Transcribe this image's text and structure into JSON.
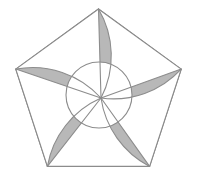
{
  "figure": {
    "name": "pentagon-pinwheel",
    "title": "Shaded regular pentagon with circular hole and five-fold pinwheel arcs",
    "canvas": {
      "width": 197,
      "height": 190,
      "background": "#ffffff"
    },
    "colors": {
      "background": "#ffffff",
      "fill": "#b8b8b8",
      "stroke": "#8c8c8c",
      "hole": "#ffffff",
      "sliver": "#ffffff"
    },
    "stroke_width": 1.1,
    "pentagon": {
      "shape": "regular-pentagon",
      "center": {
        "x": 98.5,
        "y": 96.0
      },
      "circumradius": 87.0,
      "rotation_deg": -90,
      "vertex_count": 5,
      "vertices": [
        {
          "label": "top",
          "x": 98.5,
          "y": 9.0
        },
        {
          "label": "right",
          "x": 181.2,
          "y": 69.1
        },
        {
          "label": "bottom-right",
          "x": 149.6,
          "y": 166.4
        },
        {
          "label": "bottom-left",
          "x": 47.4,
          "y": 166.4
        },
        {
          "label": "left",
          "x": 15.8,
          "y": 69.1
        }
      ]
    },
    "hole": {
      "shape": "circle",
      "center": {
        "x": 99.0,
        "y": 95.0
      },
      "radius": 33.0,
      "fill": "#ffffff"
    },
    "arcs": {
      "count": 5,
      "description": "One curved arc springs from each pentagon vertex and sweeps clockwise into a common convergence point just right of and below the figure centre, producing a five-fold pinwheel.",
      "convergence_point": {
        "x": 101.0,
        "y": 98.0
      },
      "sweep": "clockwise",
      "curvature_radius": 92.0
    },
    "slivers": {
      "count": 5,
      "description": "A thin white wedge sits at each pentagon vertex between the straight vertex-to-centre chord and the adjacent curved arc."
    }
  }
}
